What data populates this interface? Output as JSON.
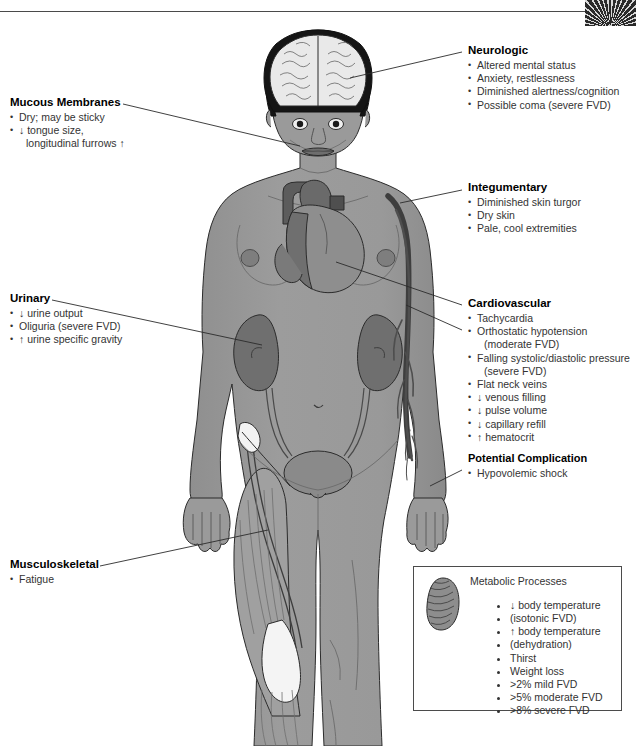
{
  "page": {
    "corner_photo": "microscope-photo-fragment"
  },
  "blocks": {
    "neurologic": {
      "heading": "Neurologic",
      "items": [
        "Altered mental status",
        "Anxiety, restlessness",
        "Diminished alertness/cognition",
        "Possible coma (severe FVD)"
      ]
    },
    "mucous_membranes": {
      "heading": "Mucous Membranes",
      "items": [
        "Dry; may be sticky",
        "↓ tongue size,",
        "longitudinal furrows ↑"
      ]
    },
    "integumentary": {
      "heading": "Integumentary",
      "items": [
        "Diminished skin turgor",
        "Dry skin",
        "Pale, cool extremities"
      ]
    },
    "urinary": {
      "heading": "Urinary",
      "items": [
        "↓ urine output",
        "Oliguria (severe FVD)",
        "↑ urine specific gravity"
      ]
    },
    "cardiovascular": {
      "heading": "Cardiovascular",
      "items": [
        "Tachycardia",
        "Orthostatic hypotension",
        "(moderate FVD)",
        "Falling systolic/diastolic pressure",
        "(severe FVD)",
        "Flat neck veins",
        "↓ venous filling",
        "↓ pulse volume",
        "↓ capillary refill",
        "↑ hematocrit"
      ],
      "sub_heading": "Potential Complication",
      "sub_items": [
        "Hypovolemic shock"
      ]
    },
    "musculoskeletal": {
      "heading": "Musculoskeletal",
      "items": [
        "Fatigue"
      ]
    },
    "metabolic": {
      "heading": "Metabolic Processes",
      "icon": "mitochondrion-icon",
      "items": [
        "↓ body temperature",
        "(isotonic FVD)",
        "↑ body temperature",
        "(dehydration)",
        "Thirst",
        "Weight loss",
        ">2% mild FVD",
        ">5% moderate FVD",
        ">8% severe FVD"
      ]
    }
  },
  "figure": {
    "name": "human-anatomy-figure",
    "organs": [
      "brain",
      "heart",
      "kidney-left",
      "kidney-right",
      "bladder",
      "ureters",
      "arm-vasculature",
      "thigh-musculature"
    ]
  },
  "colors": {
    "skin": "#9a9a9a",
    "skin_shadow": "#8d8d8d",
    "hair": "#151515",
    "brain": "#e9e9e9",
    "organ_dark": "#6f6f6f",
    "organ_mid": "#8a8a8a",
    "muscle": "#a0a0a0",
    "muscle_light": "#f2f2f2",
    "vessel": "#5a5a5a",
    "outline": "#2b2b2b",
    "text": "#333333",
    "heading": "#000000"
  }
}
